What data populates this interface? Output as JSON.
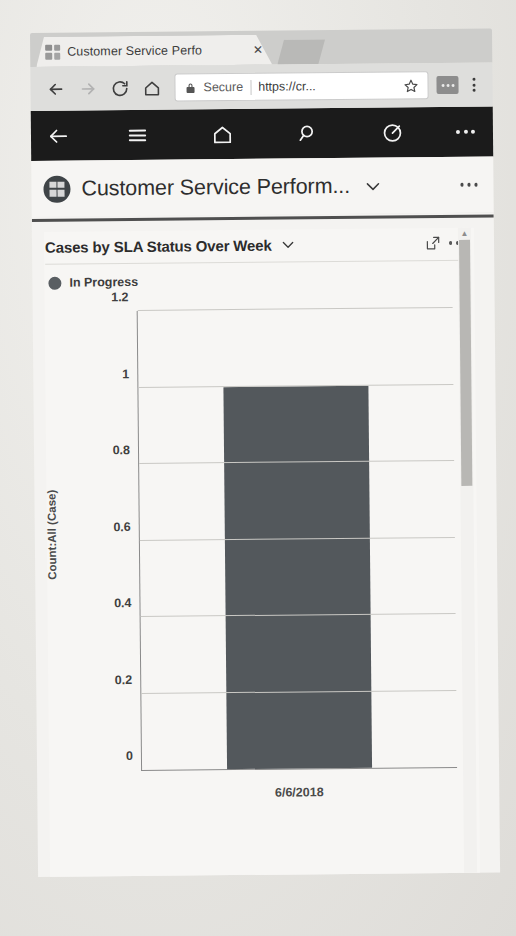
{
  "browser": {
    "window_controls": [
      {
        "name": "tab-search",
        "glyph": "⌄"
      },
      {
        "name": "minimize",
        "glyph": "–"
      },
      {
        "name": "maximize",
        "glyph": "⊔"
      },
      {
        "name": "close",
        "glyph": "⌃"
      }
    ],
    "tab": {
      "title": "Customer Service Perfo",
      "close_label": "✕",
      "favicon": "grid-favicon"
    },
    "toolbar": {
      "back_icon": "back-arrow-icon",
      "forward_icon": "forward-arrow-icon",
      "reload_icon": "reload-icon",
      "home_icon": "home-icon",
      "security_label": "Secure",
      "url": "https://cr...",
      "url_placeholder": "Search or type URL",
      "lock_icon": "lock-icon",
      "star_icon": "bookmark-star-icon",
      "extensions_icon": "extensions-icon",
      "menu_icon": "kebab-menu-icon"
    }
  },
  "appbar": {
    "items": [
      {
        "name": "back-button",
        "icon": "back-arrow-icon"
      },
      {
        "name": "site-map-button",
        "icon": "hamburger-icon"
      },
      {
        "name": "home-button",
        "icon": "home-icon"
      },
      {
        "name": "search-button",
        "icon": "search-icon"
      },
      {
        "name": "advanced-find-button",
        "icon": "advanced-find-icon"
      },
      {
        "name": "overflow-button",
        "icon": "ellipsis-icon"
      }
    ]
  },
  "app_header": {
    "title": "Customer Service Perform...",
    "logo": "dynamics-grid-logo",
    "chevron": "chevron-down-icon",
    "overflow": "ellipsis-icon"
  },
  "chart_card": {
    "title": "Cases by SLA Status Over Week",
    "title_chevron": "chevron-down-icon",
    "expand_icon": "expand-icon",
    "overflow": "ellipsis-icon",
    "legend": [
      {
        "label": "In Progress",
        "color": "#595e62"
      }
    ]
  },
  "colors": {
    "bar": "#53585c",
    "appbar_bg": "#1b1b1b",
    "card_bg": "#f7f6f4",
    "gridline": "#c9c8c4"
  },
  "scrollbar": {
    "up_arrow": "▲"
  },
  "ghost_text": {
    "line1": "   ",
    "line2": "   "
  },
  "chart_data": {
    "type": "bar",
    "title": "Cases by SLA Status Over Week",
    "categories": [
      "6/6/2018"
    ],
    "series": [
      {
        "name": "In Progress",
        "values": [
          1
        ],
        "color": "#53585c"
      }
    ],
    "xlabel": "",
    "ylabel": "Count:All (Case)",
    "ylim": [
      0,
      1.2
    ],
    "yticks": [
      0,
      0.2,
      0.4,
      0.6,
      0.8,
      1,
      1.2
    ],
    "ytick_labels": [
      "0",
      "0.2",
      "0.4",
      "0.6",
      "0.8",
      "1",
      "1.2"
    ],
    "grid": true,
    "legend_position": "top-left"
  }
}
